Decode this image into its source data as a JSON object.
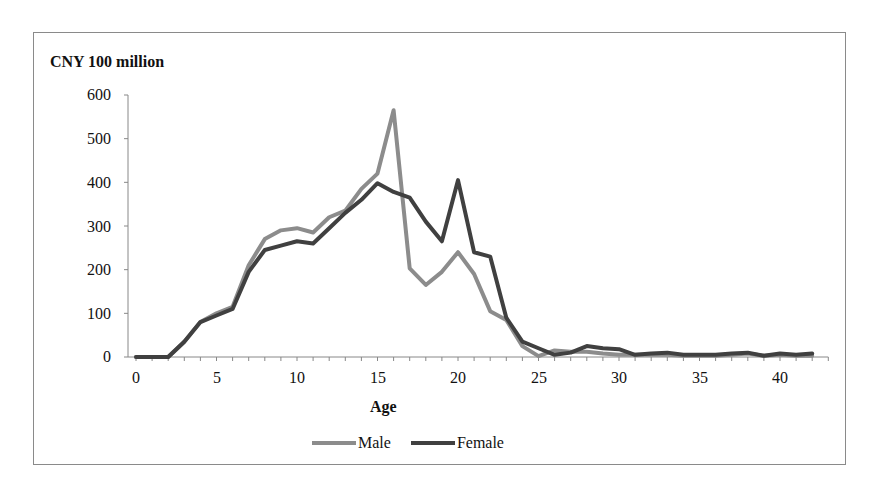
{
  "chart_data": {
    "type": "line",
    "title": "",
    "ylabel": "CNY 100 million",
    "xlabel": "Age",
    "ylim": [
      0,
      600
    ],
    "xlim": [
      0,
      43
    ],
    "yticks": [
      0,
      100,
      200,
      300,
      400,
      500,
      600
    ],
    "xticks": [
      0,
      5,
      10,
      15,
      20,
      25,
      30,
      35,
      40
    ],
    "grid": false,
    "legend_position": "bottom",
    "x": [
      0,
      1,
      2,
      3,
      4,
      5,
      6,
      7,
      8,
      9,
      10,
      11,
      12,
      13,
      14,
      15,
      16,
      17,
      18,
      19,
      20,
      21,
      22,
      23,
      24,
      25,
      26,
      27,
      28,
      29,
      30,
      31,
      32,
      33,
      34,
      35,
      36,
      37,
      38,
      39,
      40,
      41,
      42
    ],
    "series": [
      {
        "name": "Male",
        "color": "#8c8c8c",
        "values": [
          0,
          0,
          0,
          35,
          80,
          100,
          115,
          210,
          270,
          290,
          295,
          285,
          320,
          335,
          385,
          420,
          565,
          203,
          165,
          195,
          240,
          190,
          105,
          85,
          25,
          2,
          15,
          12,
          12,
          8,
          5,
          5,
          5,
          5,
          3,
          3,
          3,
          5,
          8,
          3,
          5,
          3,
          3
        ]
      },
      {
        "name": "Female",
        "color": "#404040",
        "values": [
          0,
          0,
          0,
          35,
          80,
          95,
          110,
          195,
          245,
          255,
          265,
          260,
          295,
          330,
          360,
          398,
          378,
          365,
          310,
          265,
          405,
          240,
          230,
          90,
          35,
          20,
          5,
          10,
          25,
          20,
          18,
          5,
          8,
          10,
          5,
          5,
          5,
          8,
          10,
          3,
          8,
          5,
          8
        ]
      }
    ]
  },
  "axis": {
    "y_title": "CNY 100 million",
    "x_title": "Age",
    "y_ticks": [
      "600",
      "500",
      "400",
      "300",
      "200",
      "100",
      "0"
    ],
    "x_ticks": [
      "0",
      "5",
      "10",
      "15",
      "20",
      "25",
      "30",
      "35",
      "40"
    ]
  },
  "legend": {
    "male": "Male",
    "female": "Female"
  }
}
